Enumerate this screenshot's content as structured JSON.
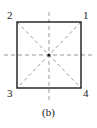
{
  "figure": {
    "caption": "(b)",
    "background_color": "#ffffff",
    "outline_color": "#1a1a1a",
    "dash_color": "#9a9a9a",
    "center_dot_color": "#1a1a1a",
    "label_color": "#1a1a1a",
    "shape": "square",
    "corner_labels": [
      {
        "id": "1",
        "text": "1",
        "position": "top-right"
      },
      {
        "id": "2",
        "text": "2",
        "position": "top-left"
      },
      {
        "id": "3",
        "text": "3",
        "position": "bottom-left"
      },
      {
        "id": "4",
        "text": "4",
        "position": "bottom-right"
      }
    ],
    "geometry": {
      "square_left": 17,
      "square_top": 22,
      "square_right": 81,
      "square_bottom": 88,
      "center_x": 49,
      "center_y": 55,
      "vertical_axis_top": 12,
      "vertical_axis_bottom": 102,
      "horizontal_axis_left": 4,
      "horizontal_axis_right": 94
    },
    "elements": {
      "square_outline": "solid square border",
      "diagonals": "two dashed diagonals corner to corner",
      "vertical_symmetry_axis": "dashed vertical line through center extending past square",
      "horizontal_symmetry_axis": "dashed horizontal line through center extending past square",
      "center_marker": "filled dot at center"
    }
  }
}
